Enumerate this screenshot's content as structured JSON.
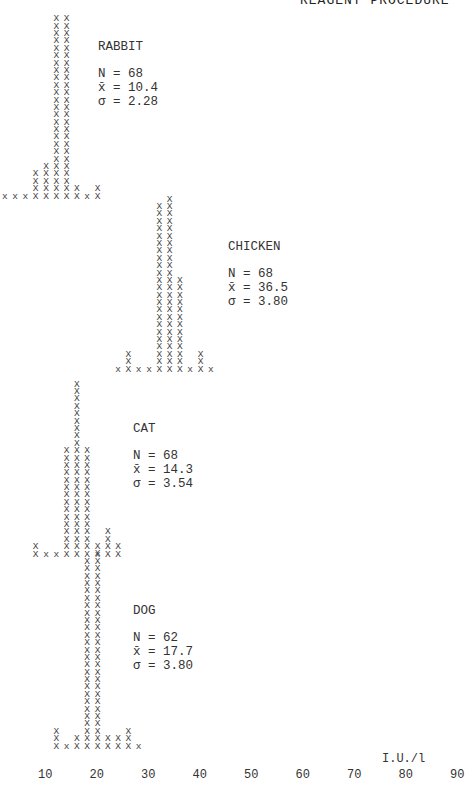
{
  "header": {
    "text": "REAGENT PROCEDURE"
  },
  "chart_data": {
    "type": "histogram",
    "title": "",
    "xlabel": "I.U./l",
    "ylabel": "",
    "x_ticks": [
      10,
      20,
      30,
      40,
      50,
      60,
      70,
      80,
      90
    ],
    "panels": [
      {
        "name": "RABBIT",
        "N": "68",
        "mean": "10.4",
        "sd": "2.28",
        "bins": [
          {
            "x": 2,
            "count": 1
          },
          {
            "x": 4,
            "count": 1
          },
          {
            "x": 6,
            "count": 1
          },
          {
            "x": 8,
            "count": 4
          },
          {
            "x": 10,
            "count": 5
          },
          {
            "x": 12,
            "count": 25
          },
          {
            "x": 14,
            "count": 25
          },
          {
            "x": 16,
            "count": 2
          },
          {
            "x": 18,
            "count": 1
          },
          {
            "x": 20,
            "count": 2
          }
        ]
      },
      {
        "name": "CHICKEN",
        "N": "68",
        "mean": "36.5",
        "sd": "3.80",
        "bins": [
          {
            "x": 24,
            "count": 1
          },
          {
            "x": 26,
            "count": 3
          },
          {
            "x": 28,
            "count": 1
          },
          {
            "x": 30,
            "count": 1
          },
          {
            "x": 32,
            "count": 23
          },
          {
            "x": 34,
            "count": 24
          },
          {
            "x": 36,
            "count": 13
          },
          {
            "x": 38,
            "count": 1
          },
          {
            "x": 40,
            "count": 3
          },
          {
            "x": 42,
            "count": 1
          }
        ]
      },
      {
        "name": "CAT",
        "N": "68",
        "mean": "14.3",
        "sd": "3.54",
        "bins": [
          {
            "x": 8,
            "count": 2
          },
          {
            "x": 10,
            "count": 1
          },
          {
            "x": 12,
            "count": 1
          },
          {
            "x": 14,
            "count": 15
          },
          {
            "x": 16,
            "count": 24
          },
          {
            "x": 18,
            "count": 15
          },
          {
            "x": 20,
            "count": 1
          },
          {
            "x": 22,
            "count": 4
          },
          {
            "x": 24,
            "count": 2
          }
        ]
      },
      {
        "name": "DOG",
        "N": "62",
        "mean": "17.7",
        "sd": "3.80",
        "bins": [
          {
            "x": 12,
            "count": 3
          },
          {
            "x": 14,
            "count": 1
          },
          {
            "x": 16,
            "count": 2
          },
          {
            "x": 18,
            "count": 26
          },
          {
            "x": 20,
            "count": 28
          },
          {
            "x": 22,
            "count": 2
          },
          {
            "x": 24,
            "count": 2
          },
          {
            "x": 26,
            "count": 3
          },
          {
            "x": 28,
            "count": 1
          }
        ]
      }
    ]
  },
  "labels": {
    "n_prefix": "N = ",
    "mean_prefix": "x̄ = ",
    "sd_prefix": "σ = "
  }
}
